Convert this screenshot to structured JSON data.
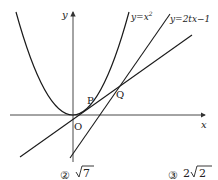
{
  "diagram": {
    "axes": {
      "x_label": "x",
      "y_label": "y",
      "origin_label": "O"
    },
    "curves": [
      {
        "name": "parabola",
        "label": "y=x²",
        "label_base": "y=x",
        "label_sup": "2"
      },
      {
        "name": "tangent-line",
        "label": "y=2tx−1"
      },
      {
        "name": "line-through-origin",
        "label": ""
      }
    ],
    "points": [
      {
        "name": "P",
        "label": "P"
      },
      {
        "name": "Q",
        "label": "Q"
      }
    ]
  },
  "choices": [
    {
      "number": "②",
      "value": "√7",
      "coef": "",
      "radicand": "7"
    },
    {
      "number": "③",
      "value": "2√2",
      "coef": "2",
      "radicand": "2"
    }
  ],
  "colors": {
    "stroke": "#1a1a1a",
    "axis": "#333333",
    "background": "#ffffff"
  }
}
